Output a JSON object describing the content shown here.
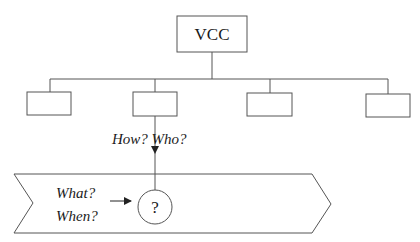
{
  "diagram": {
    "root": {
      "label": "VCC"
    },
    "children": [
      {
        "label": ""
      },
      {
        "label": ""
      },
      {
        "label": ""
      },
      {
        "label": ""
      }
    ],
    "vertical_question": "How? Who?",
    "process": {
      "question_left_line1": "What?",
      "question_left_line2": "When?",
      "node_label": "?"
    },
    "colors": {
      "stroke": "#555555",
      "text": "#1a1a1a",
      "background": "#ffffff"
    }
  }
}
